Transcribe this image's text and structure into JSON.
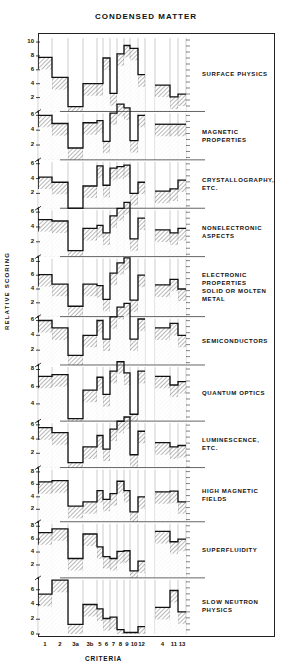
{
  "chart_data": {
    "type": "bar",
    "subtype": "stacked-step-histogram-panels",
    "title": "CONDENSED MATTER",
    "xlabel": "CRITERIA",
    "ylabel": "RELATIVE SCORING",
    "categories": [
      "1",
      "2",
      "3a",
      "3b",
      "5",
      "6",
      "7",
      "8",
      "9",
      "10",
      "12",
      "4",
      "11",
      "13"
    ],
    "category_groups": [
      [
        "1",
        "2",
        "3a",
        "3b",
        "5",
        "6",
        "7",
        "8",
        "9",
        "10",
        "12"
      ],
      [
        "4",
        "11",
        "13"
      ]
    ],
    "grid": false,
    "legend": null,
    "panels": [
      {
        "name": "SURFACE PHYSICS",
        "yticks": [
          "2",
          "4",
          "6",
          "8",
          "10"
        ],
        "ylim": [
          0,
          10
        ],
        "values": [
          7.8,
          4.9,
          0.7,
          4.0,
          4.0,
          7.7,
          2.6,
          8.3,
          9.5,
          9.1,
          5.3,
          3.8,
          2.1,
          2.5
        ]
      },
      {
        "name": "MAGNETIC\nPROPERTIES",
        "yticks": [
          "2",
          "4",
          "6"
        ],
        "ylim": [
          0,
          6
        ],
        "values": [
          6.0,
          4.9,
          1.6,
          5.0,
          5.3,
          2.5,
          6.3,
          7.5,
          7.0,
          2.6,
          6.0,
          4.8,
          4.8,
          4.8
        ]
      },
      {
        "name": "CRYSTALLOGRAPHY,\nETC.",
        "yticks": [
          "2",
          "4",
          "6"
        ],
        "ylim": [
          0,
          6
        ],
        "values": [
          4.2,
          3.5,
          0.0,
          3.0,
          5.7,
          3.1,
          5.4,
          5.6,
          5.8,
          2.0,
          3.5,
          2.3,
          2.6,
          3.8
        ]
      },
      {
        "name": "NONELECTRONIC\nASPECTS",
        "yticks": [
          "2",
          "4",
          "6"
        ],
        "ylim": [
          0,
          6
        ],
        "values": [
          5.0,
          4.8,
          0.8,
          3.8,
          4.2,
          3.2,
          5.5,
          6.5,
          7.3,
          2.4,
          5.2,
          3.6,
          3.2,
          3.8
        ]
      },
      {
        "name": "ELECTRONIC\nPROPERTIES\nSOLID  OR  MOLTEN\nMETAL",
        "yticks": [
          "2",
          "4",
          "6",
          "8"
        ],
        "ylim": [
          0,
          8
        ],
        "values": [
          6.1,
          4.7,
          1.5,
          4.7,
          4.5,
          2.5,
          6.3,
          7.8,
          8.5,
          2.4,
          6.0,
          4.6,
          5.4,
          4.0
        ]
      },
      {
        "name": "SEMICONDUCTORS",
        "yticks": [
          "2",
          "4",
          "6"
        ],
        "ylim": [
          0,
          6
        ],
        "values": [
          6.0,
          5.0,
          1.3,
          4.0,
          6.0,
          3.5,
          6.5,
          7.8,
          8.3,
          3.5,
          6.2,
          5.0,
          5.6,
          4.0
        ]
      },
      {
        "name": "QUANTUM  OPTICS",
        "yticks": [
          "4",
          "6",
          "8"
        ],
        "ylim": [
          2,
          8
        ],
        "values": [
          7.2,
          7.4,
          2.3,
          5.6,
          7.1,
          5.1,
          7.8,
          8.9,
          7.6,
          2.8,
          7.8,
          7.2,
          6.2,
          6.6
        ]
      },
      {
        "name": "LUMINESCENCE,\nETC.",
        "yticks": [
          "2",
          "4",
          "6"
        ],
        "ylim": [
          0,
          6
        ],
        "values": [
          5.6,
          4.9,
          0.7,
          2.9,
          4.5,
          2.6,
          5.4,
          6.5,
          7.1,
          1.8,
          5.1,
          3.5,
          2.9,
          3.1
        ]
      },
      {
        "name": "HIGH  MAGNETIC\nFIELDS",
        "yticks": [
          "2",
          "4",
          "6",
          "8"
        ],
        "ylim": [
          0,
          8
        ],
        "values": [
          6.4,
          6.6,
          2.5,
          3.2,
          5.0,
          3.6,
          4.5,
          6.5,
          5.0,
          1.6,
          4.0,
          4.8,
          4.9,
          3.2
        ]
      },
      {
        "name": "SUPERFLUIDITY",
        "yticks": [
          "2",
          "4",
          "6",
          "8"
        ],
        "ylim": [
          0,
          8
        ],
        "values": [
          7.0,
          7.6,
          3.0,
          6.8,
          4.8,
          3.3,
          3.0,
          4.1,
          4.2,
          1.1,
          2.6,
          7.2,
          5.6,
          6.0
        ]
      },
      {
        "name": "SLOW  NEUTRON\nPHYSICS",
        "yticks": [
          "0",
          "2",
          "4",
          "6"
        ],
        "ylim": [
          0,
          7
        ],
        "values": [
          5.4,
          7.3,
          1.3,
          4.0,
          3.4,
          2.1,
          2.3,
          0.6,
          0.2,
          0.2,
          1.0,
          3.6,
          5.9,
          3.0
        ]
      }
    ]
  },
  "labels": {
    "title": "CONDENSED MATTER",
    "xlabel": "CRITERIA",
    "ylabel": "RELATIVE SCORING"
  },
  "colors": {
    "ink": "#1a1a1a",
    "hatch": "#444444",
    "paper": "#ffffff"
  }
}
